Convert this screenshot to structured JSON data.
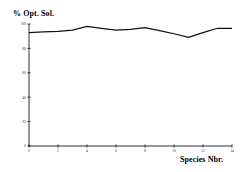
{
  "chart_data": {
    "type": "line",
    "title": "",
    "subtitle": "",
    "ylabel": "% Opt. Sol.",
    "xlabel": "Species Nbr.",
    "xlim": [
      0,
      14
    ],
    "ylim": [
      0,
      100
    ],
    "grid": false,
    "legend": false,
    "legend_position": "none",
    "line_color": "#111111",
    "background_color": "#ffffff",
    "axis_color": "#1a1a1a",
    "yticks": [
      0,
      20,
      40,
      60,
      80,
      100
    ],
    "ytick_labels": [
      "0",
      "20",
      "40",
      "60",
      "80",
      "100"
    ],
    "xticks": [
      0,
      2,
      4,
      6,
      8,
      10,
      12,
      14
    ],
    "xtick_labels": [
      "0",
      "2",
      "4",
      "6",
      "8",
      "10",
      "12",
      "14"
    ],
    "series": [
      {
        "name": "% Opt. Sol.",
        "x": [
          0,
          1,
          2,
          3,
          4,
          5,
          6,
          7,
          8,
          9,
          10,
          11,
          12,
          13,
          14
        ],
        "values": [
          93,
          93.5,
          94,
          95,
          98,
          96.5,
          95,
          95.5,
          97,
          94.5,
          92,
          89,
          93,
          96.5,
          96.5
        ]
      }
    ]
  }
}
